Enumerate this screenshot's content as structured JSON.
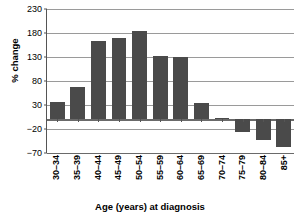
{
  "chart_data": {
    "type": "bar",
    "title": "",
    "xlabel": "Age (years) at diagnosis",
    "ylabel": "% change",
    "categories": [
      "30–34",
      "35–39",
      "40–44",
      "45–49",
      "50–54",
      "55–59",
      "60–64",
      "65–69",
      "70–74",
      "75–79",
      "80–84",
      "85+"
    ],
    "values": [
      36,
      68,
      163,
      170,
      185,
      132,
      129,
      35,
      3,
      -26,
      -43,
      -57
    ],
    "ylim": [
      -70,
      230
    ],
    "yticks": [
      230,
      180,
      130,
      80,
      30,
      -20,
      -70
    ],
    "ytick_labels": [
      "230",
      "180",
      "130",
      "80",
      "30",
      "−20",
      "−70"
    ],
    "grid": true,
    "legend": "none",
    "bar_color": "#4a4a4a",
    "gridline_color": "#9a9a9a",
    "axis_color": "#555555",
    "background": "#ffffff"
  }
}
